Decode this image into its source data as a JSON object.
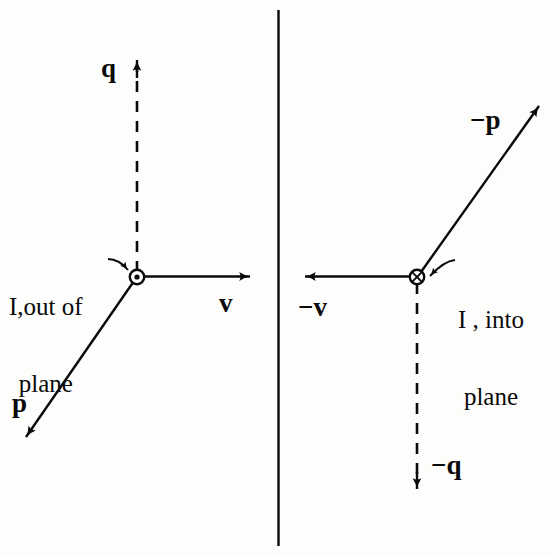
{
  "figure": {
    "background_color": "#fdfdfc",
    "ink_color": "#0a0a0a",
    "width": 558,
    "height": 557,
    "divider": {
      "x": 278,
      "y_top": 10,
      "y_bottom": 546
    }
  },
  "left_panel": {
    "name": "out-of-plane-current",
    "origin": {
      "x": 137,
      "y": 277
    },
    "current_marker": "circle-dot-out-of-page",
    "annotation": {
      "line1": "I,out of",
      "line2": "plane",
      "x": 8,
      "y": 242
    },
    "vectors": [
      {
        "name": "q",
        "label": "q",
        "style": "dashed",
        "direction": "up",
        "tip": {
          "x": 137,
          "y": 57
        },
        "label_pos": {
          "x": 104,
          "y": 58
        }
      },
      {
        "name": "v",
        "label": "v",
        "style": "solid",
        "direction": "right",
        "tip": {
          "x": 253,
          "y": 276
        },
        "label_pos": {
          "x": 220,
          "y": 292
        }
      },
      {
        "name": "p",
        "label": "p",
        "style": "solid",
        "direction": "down-left",
        "tip": {
          "x": 24,
          "y": 440
        },
        "label_pos": {
          "x": 12,
          "y": 392
        }
      }
    ]
  },
  "right_panel": {
    "name": "into-plane-current",
    "origin": {
      "x": 417,
      "y": 277
    },
    "current_marker": "circle-cross-into-page",
    "annotation": {
      "line1": "I , into",
      "line2": "plane",
      "x": 457,
      "y": 255
    },
    "vectors": [
      {
        "name": "minus-p",
        "label": "−p",
        "style": "solid",
        "direction": "up-right",
        "tip": {
          "x": 541,
          "y": 104
        },
        "label_pos": {
          "x": 472,
          "y": 110
        }
      },
      {
        "name": "minus-v",
        "label": "−v",
        "style": "solid",
        "direction": "left",
        "tip": {
          "x": 302,
          "y": 276
        },
        "label_pos": {
          "x": 300,
          "y": 296
        }
      },
      {
        "name": "minus-q",
        "label": "−q",
        "style": "dashed",
        "direction": "down",
        "tip": {
          "x": 417,
          "y": 492
        },
        "label_pos": {
          "x": 432,
          "y": 455
        }
      }
    ]
  }
}
